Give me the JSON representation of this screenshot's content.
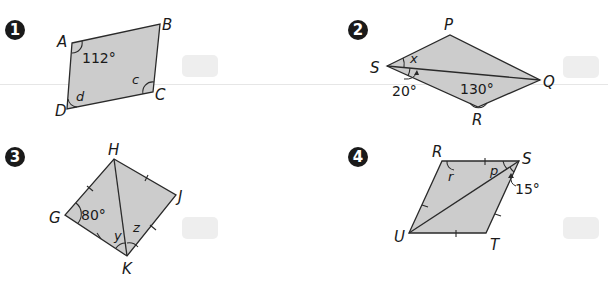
{
  "problems": [
    {
      "number": "1",
      "vertices": {
        "A": "A",
        "B": "B",
        "C": "C",
        "D": "D"
      },
      "given_angle": "112°",
      "unknowns": [
        "c",
        "d"
      ],
      "answer": ""
    },
    {
      "number": "2",
      "vertices": {
        "P": "P",
        "Q": "Q",
        "R": "R",
        "S": "S"
      },
      "given_angles": [
        "20°",
        "130°"
      ],
      "unknowns": [
        "x"
      ],
      "answer": ""
    },
    {
      "number": "3",
      "vertices": {
        "G": "G",
        "H": "H",
        "J": "J",
        "K": "K"
      },
      "given_angle": "80°",
      "unknowns": [
        "y",
        "z"
      ],
      "answer": ""
    },
    {
      "number": "4",
      "vertices": {
        "R": "R",
        "S": "S",
        "T": "T",
        "U": "U"
      },
      "given_angle": "15°",
      "unknowns": [
        "r",
        "p"
      ],
      "answer": ""
    }
  ],
  "colors": {
    "fill": "#cccccc",
    "stroke": "#2a2a2a",
    "badge": "#1a1a1a",
    "answer_box": "#eeeeee"
  }
}
